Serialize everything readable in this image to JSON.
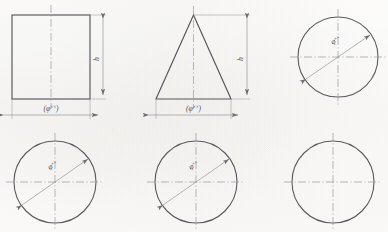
{
  "figure": {
    "sheet_background": "#fdfdfc",
    "line_color": "#56565a",
    "centerline_color": "#9a9a9e",
    "dimension_color": "#8e8e92"
  },
  "labels": {
    "phi_symbol": "φ",
    "xx": "××",
    "width_open": "(",
    "width_close": ")",
    "height_symbol": "h"
  },
  "shapes": [
    {
      "id": "square",
      "name": "square-profile",
      "type": "rectangle",
      "row": "top",
      "column": 1,
      "has_vertical_centerline": true,
      "has_horizontal_centerline": false,
      "dimensions": [
        {
          "id": "square-width",
          "orientation": "horizontal",
          "label": "(φ××)"
        },
        {
          "id": "square-height",
          "orientation": "vertical",
          "label": "h"
        }
      ]
    },
    {
      "id": "triangle",
      "name": "triangle-profile",
      "type": "triangle",
      "row": "top",
      "column": 2,
      "has_vertical_centerline": true,
      "has_horizontal_centerline": false,
      "dimensions": [
        {
          "id": "triangle-width",
          "orientation": "horizontal",
          "label": "(φ××)"
        },
        {
          "id": "triangle-height",
          "orientation": "vertical",
          "label": "h"
        }
      ]
    },
    {
      "id": "circle-top-right",
      "name": "circle-profile-top-right",
      "type": "circle",
      "row": "top",
      "column": 3,
      "has_vertical_centerline": true,
      "has_horizontal_centerline": true,
      "dimensions": [
        {
          "id": "circle-tr-diameter",
          "orientation": "diagonal",
          "label": "φ××"
        }
      ]
    },
    {
      "id": "circle-bottom-left",
      "name": "circle-profile-bottom-left",
      "type": "circle",
      "row": "bottom",
      "column": 1,
      "has_vertical_centerline": true,
      "has_horizontal_centerline": true,
      "dimensions": [
        {
          "id": "circle-bl-diameter",
          "orientation": "diagonal",
          "label": "φ××"
        }
      ]
    },
    {
      "id": "circle-bottom-center",
      "name": "circle-profile-bottom-center",
      "type": "circle",
      "row": "bottom",
      "column": 2,
      "has_vertical_centerline": true,
      "has_horizontal_centerline": true,
      "dimensions": [
        {
          "id": "circle-bc-diameter",
          "orientation": "diagonal",
          "label": "φ××"
        }
      ]
    },
    {
      "id": "circle-bottom-right",
      "name": "circle-profile-bottom-right",
      "type": "circle",
      "row": "bottom",
      "column": 3,
      "has_vertical_centerline": true,
      "has_horizontal_centerline": true,
      "dimensions": []
    }
  ]
}
